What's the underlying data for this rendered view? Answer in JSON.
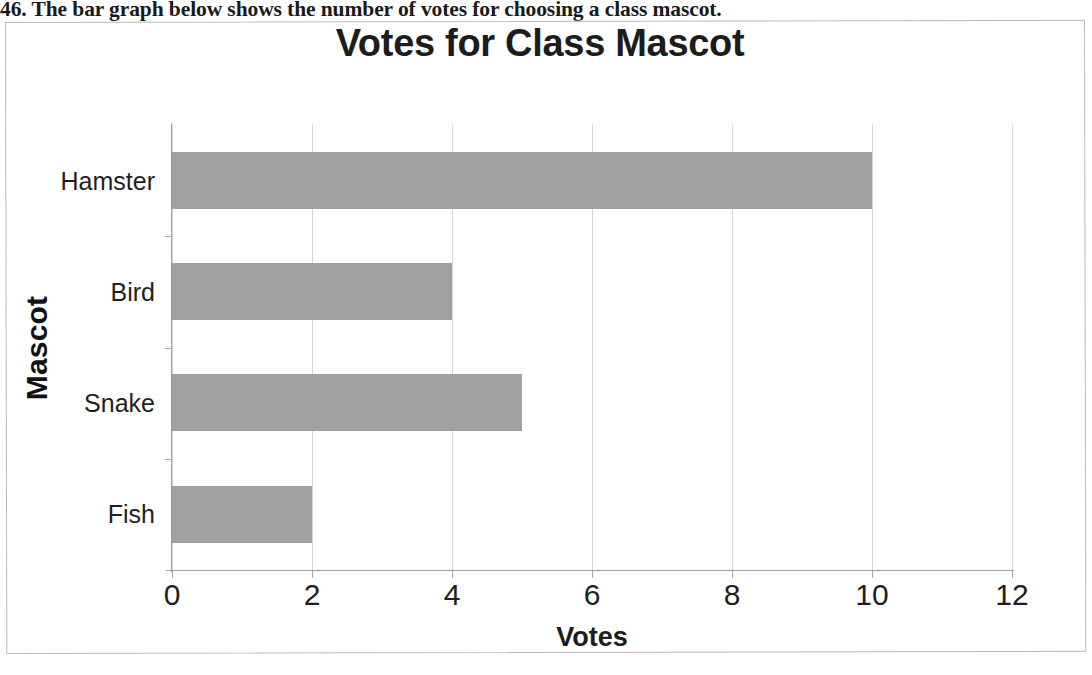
{
  "worksheet": {
    "question_number": "46.",
    "question_text": "46. The bar graph below shows the number of votes for choosing a class mascot."
  },
  "chart_data": {
    "type": "bar",
    "orientation": "horizontal",
    "title": "Votes for Class Mascot",
    "xlabel": "Votes",
    "ylabel": "Mascot",
    "categories": [
      "Hamster",
      "Bird",
      "Snake",
      "Fish"
    ],
    "values": [
      10,
      4,
      5,
      2
    ],
    "xlim": [
      0,
      12
    ],
    "xticks": [
      "0",
      "2",
      "4",
      "6",
      "8",
      "10",
      "12"
    ],
    "xtick_values": [
      0,
      2,
      4,
      6,
      8,
      10,
      12
    ],
    "grid": "vertical",
    "legend": "none",
    "bar_color": "#9a9a9a",
    "gridline_color": "#d6d6d6",
    "axis_color": "#9d9d9d",
    "title_color": "#1c1c1c",
    "text_color": "#1f1f1f"
  }
}
